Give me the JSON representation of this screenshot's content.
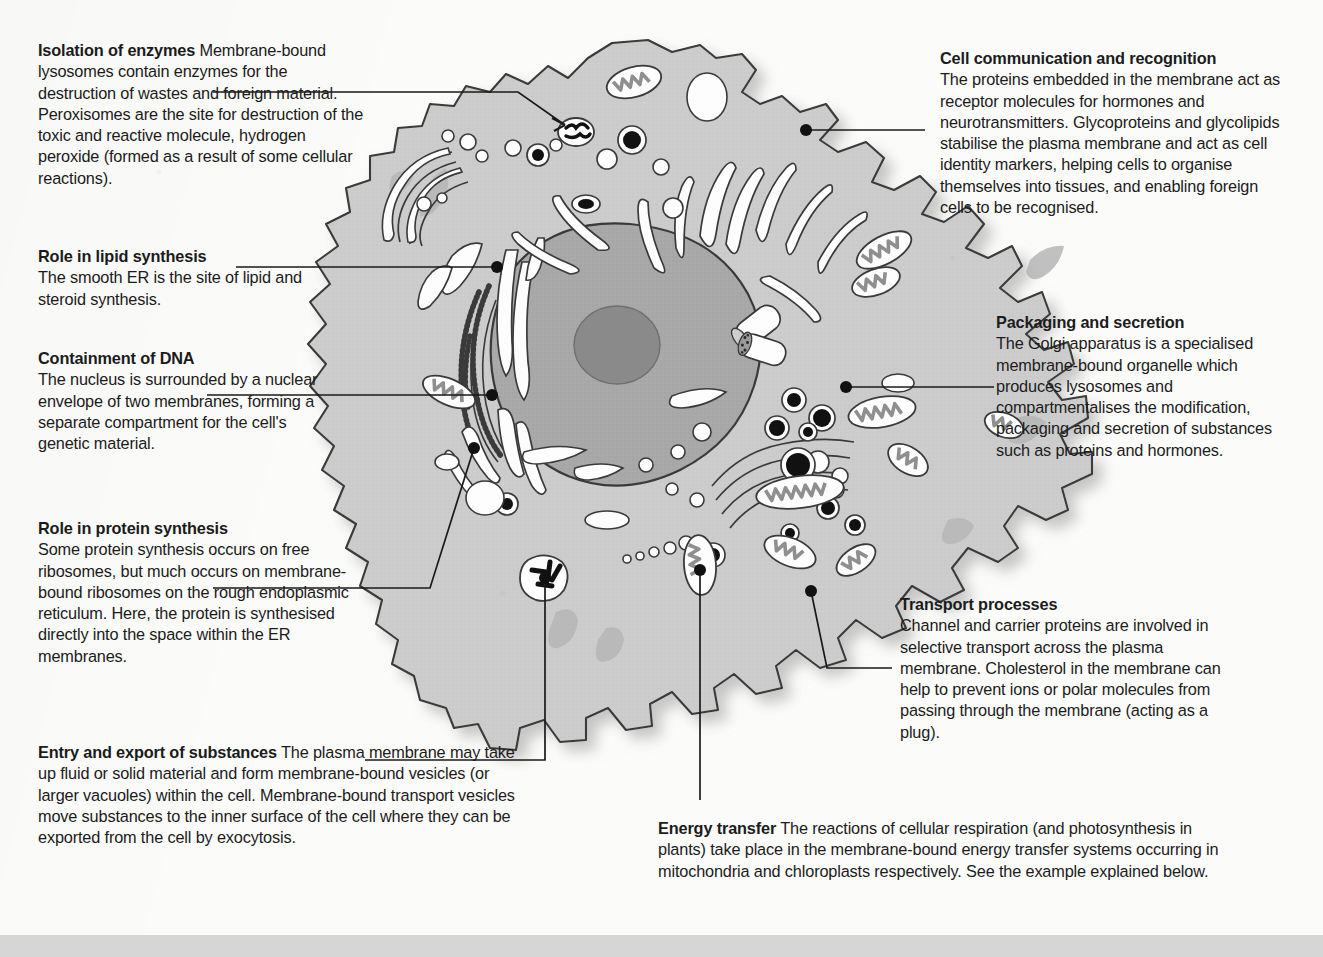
{
  "figure": {
    "title_semantic": "functions-of-membranes-in-a-cell",
    "colors": {
      "cytoplasm": "#cccccc",
      "cytoplasm_dark": "#b4b4b4",
      "nucleus": "#a8a8a8",
      "nucleolus": "#8a8a8a",
      "outline": "#3a3a3a",
      "lumen": "#fdfdfd",
      "leader": "#1a1a1a",
      "page_background": "#fbfbfa",
      "bottom_strip": "#d6d6d6"
    }
  },
  "callouts": [
    {
      "id": "isolation-of-enzymes",
      "heading": "Isolation of enzymes",
      "body": "Membrane-bound lysosomes contain enzymes for the destruction of wastes and foreign material. Peroxisomes are the site for destruction of the toxic and reactive molecule, hydrogen peroxide (formed as a result of some cellular reactions).",
      "inline_heading": true
    },
    {
      "id": "role-in-lipid-synthesis",
      "heading": "Role in lipid synthesis",
      "body": "The smooth ER is the site of lipid and steroid synthesis.",
      "inline_heading": false
    },
    {
      "id": "containment-of-dna",
      "heading": "Containment of DNA",
      "body": "The nucleus is surrounded by a nuclear envelope of two membranes, forming a separate compartment for the cell's genetic material.",
      "inline_heading": false
    },
    {
      "id": "role-in-protein-synthesis",
      "heading": "Role in protein synthesis",
      "body": "Some protein synthesis occurs on free ribosomes, but much occurs on membrane-bound ribosomes on the rough endoplasmic reticulum. Here, the protein is synthesised directly into the space within the ER membranes.",
      "inline_heading": false
    },
    {
      "id": "entry-and-export-of-substances",
      "heading": "Entry and export of substances",
      "body": "The plasma membrane may take up fluid or solid material and form membrane-bound vesicles (or larger vacuoles) within the cell. Membrane-bound transport vesicles move substances to the inner surface of the cell where they can be exported from the cell by exocytosis.",
      "inline_heading": true
    },
    {
      "id": "cell-communication-and-recognition",
      "heading": "Cell communication and recognition",
      "body": "The proteins embedded in the membrane act as receptor molecules for hormones and neurotransmitters. Glycoproteins and glycolipids stabilise the plasma membrane and act as cell identity markers, helping cells to organise themselves into tissues, and enabling foreign cells to be recognised.",
      "inline_heading": false
    },
    {
      "id": "packaging-and-secretion",
      "heading": "Packaging and secretion",
      "body": "The Golgi apparatus is a specialised membrane-bound organelle which produces lysosomes and compartmentalises the modification, packaging and secretion of substances such as proteins and hormones.",
      "inline_heading": false
    },
    {
      "id": "transport-processes",
      "heading": "Transport processes",
      "body": "Channel and carrier proteins are involved in selective transport across the plasma membrane. Cholesterol in the membrane can help to prevent ions or polar molecules from passing through the membrane (acting as a plug).",
      "inline_heading": false
    },
    {
      "id": "energy-transfer",
      "heading": "Energy transfer",
      "body": "The reactions of cellular respiration (and photosynthesis in plants) take place in the membrane-bound energy transfer systems occurring in mitochondria and chloroplasts respectively. See the example explained below.",
      "inline_heading": true
    }
  ],
  "organelles": [
    {
      "name": "nucleus",
      "label": "nucleus"
    },
    {
      "name": "nucleolus",
      "label": "nucleolus"
    },
    {
      "name": "nuclear-envelope",
      "label": "nuclear envelope"
    },
    {
      "name": "rough-endoplasmic-reticulum",
      "label": "rough ER"
    },
    {
      "name": "smooth-endoplasmic-reticulum",
      "label": "smooth ER"
    },
    {
      "name": "golgi-apparatus",
      "label": "Golgi apparatus"
    },
    {
      "name": "mitochondrion",
      "label": "mitochondrion"
    },
    {
      "name": "lysosome",
      "label": "lysosome"
    },
    {
      "name": "peroxisome",
      "label": "peroxisome"
    },
    {
      "name": "vesicle",
      "label": "vesicle"
    },
    {
      "name": "vacuole",
      "label": "vacuole"
    },
    {
      "name": "centriole",
      "label": "centriole"
    },
    {
      "name": "plasma-membrane",
      "label": "plasma membrane"
    },
    {
      "name": "ribosome",
      "label": "ribosome"
    }
  ]
}
